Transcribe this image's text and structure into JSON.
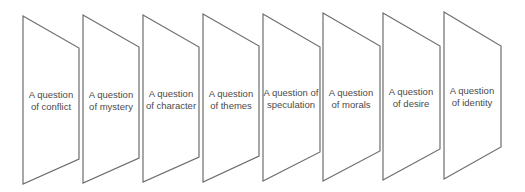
{
  "diagram": {
    "stroke_color": "#6e6e6e",
    "text_color": "#4a4a4a",
    "panels": [
      {
        "line1": "A question",
        "line2": "of conflict"
      },
      {
        "line1": "A question",
        "line2": "of mystery"
      },
      {
        "line1": "A question",
        "line2": "of character"
      },
      {
        "line1": "A question",
        "line2": "of themes"
      },
      {
        "line1": "A question of",
        "line2": "speculation"
      },
      {
        "line1": "A question",
        "line2": "of morals"
      },
      {
        "line1": "A question",
        "line2": "of desire"
      },
      {
        "line1": "A question",
        "line2": "of identity"
      }
    ]
  }
}
